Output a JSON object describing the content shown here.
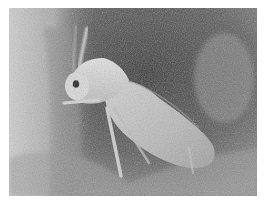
{
  "image": {
    "subject": "whitefly insect on leaf surface",
    "style": "grayscale macro photograph",
    "colors": {
      "background_dark": "#3c3c3c",
      "background_mid": "#8a8a8a",
      "background_light": "#c8c8c8",
      "insect_body": "#d6d6d6",
      "insect_wing": "#bdbdbd",
      "eye": "#1a1a1a",
      "margin": "#ffffff"
    }
  }
}
